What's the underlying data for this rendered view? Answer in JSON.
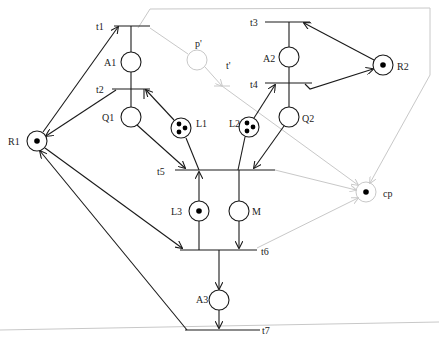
{
  "diagram": {
    "type": "petri-net",
    "colors": {
      "stroke": "#1a1a1a",
      "faint": "#c8c8c8",
      "token": "#000000",
      "background": "#ffffff"
    },
    "places": [
      {
        "id": "A1",
        "label": "A1",
        "x": 131,
        "y": 62,
        "tokens": 0
      },
      {
        "id": "Q1",
        "label": "Q1",
        "x": 131,
        "y": 117,
        "tokens": 0
      },
      {
        "id": "L1",
        "label": "L1",
        "x": 181,
        "y": 128,
        "tokens": 3
      },
      {
        "id": "R1",
        "label": "R1",
        "x": 37,
        "y": 141,
        "tokens": 1
      },
      {
        "id": "A2",
        "label": "A2",
        "x": 289,
        "y": 57,
        "tokens": 0
      },
      {
        "id": "R2",
        "label": "R2",
        "x": 383,
        "y": 65,
        "tokens": 1
      },
      {
        "id": "L2",
        "label": "L2",
        "x": 249,
        "y": 127,
        "tokens": 3
      },
      {
        "id": "Q2",
        "label": "Q2",
        "x": 289,
        "y": 117,
        "tokens": 0
      },
      {
        "id": "L3",
        "label": "L3",
        "x": 199,
        "y": 211,
        "tokens": 1
      },
      {
        "id": "M",
        "label": "M",
        "x": 239,
        "y": 211,
        "tokens": 0
      },
      {
        "id": "A3",
        "label": "A3",
        "x": 219,
        "y": 300,
        "tokens": 0
      },
      {
        "id": "p_prime",
        "label": "p'",
        "x": 197,
        "y": 60,
        "tokens": 0,
        "faint": true
      },
      {
        "id": "cp",
        "label": "cp",
        "x": 366,
        "y": 192,
        "tokens": 1,
        "faint": true
      }
    ],
    "transitions": [
      {
        "id": "t1",
        "label": "t1",
        "x1": 114,
        "x2": 150,
        "y": 26
      },
      {
        "id": "t2",
        "label": "t2",
        "x1": 112,
        "x2": 150,
        "y": 89
      },
      {
        "id": "t3",
        "label": "t3",
        "x1": 265,
        "x2": 310,
        "y": 22
      },
      {
        "id": "t4",
        "label": "t4",
        "x1": 265,
        "x2": 312,
        "y": 83
      },
      {
        "id": "t5",
        "label": "t5",
        "x1": 175,
        "x2": 275,
        "y": 170
      },
      {
        "id": "t6",
        "label": "t6",
        "x1": 180,
        "x2": 257,
        "y": 250
      },
      {
        "id": "t7",
        "label": "t7",
        "x1": 185,
        "x2": 260,
        "y": 330
      },
      {
        "id": "t_prime",
        "label": "t'",
        "x": 222,
        "y": 86,
        "faint": true
      }
    ],
    "labels": {
      "t1": "t1",
      "t2": "t2",
      "t3": "t3",
      "t4": "t4",
      "t5": "t5",
      "t6": "t6",
      "t7": "t7",
      "t_prime": "t'",
      "A1": "A1",
      "Q1": "Q1",
      "L1": "L1",
      "R1": "R1",
      "A2": "A2",
      "R2": "R2",
      "L2": "L2",
      "Q2": "Q2",
      "L3": "L3",
      "M": "M",
      "A3": "A3",
      "p_prime": "p'",
      "cp": "cp"
    }
  }
}
